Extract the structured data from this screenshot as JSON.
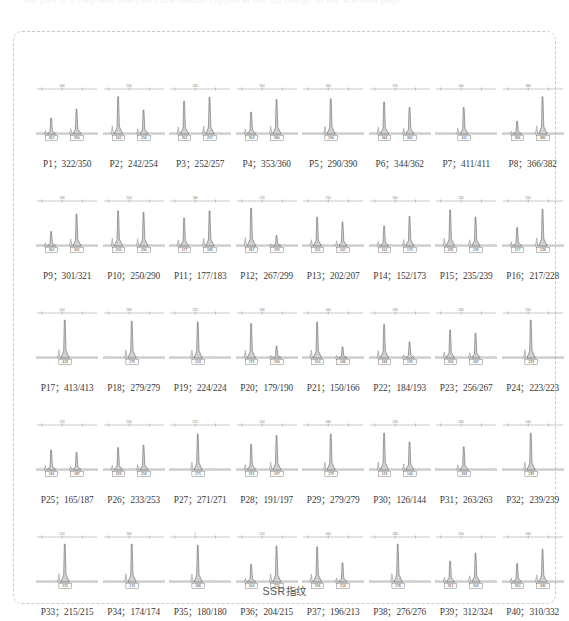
{
  "top_band": {
    "clipped_text": "the part of a fragment analysis trace header clipped at the top margin of the scanned page"
  },
  "caption": "SSR指纹",
  "figure": {
    "panel_count": 40,
    "columns": 8,
    "rows": 5
  },
  "chart_data": {
    "type": "line",
    "title": "SSR指纹",
    "xlabel": "",
    "ylabel": "",
    "grid": false,
    "legend": "none",
    "panels": [
      {
        "id": "P1",
        "label": "P1；322/350",
        "alleles": [
          322,
          350
        ],
        "homozygous": false,
        "peaks": [
          {
            "size": 322,
            "height": 0.4
          },
          {
            "size": 350,
            "height": 0.62
          }
        ],
        "scale_tick": "340"
      },
      {
        "id": "P2",
        "label": "P2；242/254",
        "alleles": [
          242,
          254
        ],
        "homozygous": false,
        "peaks": [
          {
            "size": 242,
            "height": 0.93
          },
          {
            "size": 254,
            "height": 0.6
          }
        ],
        "scale_tick": "240"
      },
      {
        "id": "P3",
        "label": "P3；252/257",
        "alleles": [
          252,
          257
        ],
        "homozygous": false,
        "peaks": [
          {
            "size": 252,
            "height": 0.82
          },
          {
            "size": 257,
            "height": 0.92
          }
        ],
        "scale_tick": "260"
      },
      {
        "id": "P4",
        "label": "P4；353/360",
        "alleles": [
          353,
          360
        ],
        "homozygous": false,
        "peaks": [
          {
            "size": 353,
            "height": 0.55
          },
          {
            "size": 360,
            "height": 0.86
          }
        ],
        "scale_tick": "350"
      },
      {
        "id": "P5",
        "label": "P5；290/390",
        "alleles": [
          290,
          390
        ],
        "homozygous": false,
        "peaks": [
          {
            "size": 290,
            "height": 0.88
          }
        ],
        "scale_tick": "300"
      },
      {
        "id": "P6",
        "label": "P6；344/362",
        "alleles": [
          344,
          362
        ],
        "homozygous": false,
        "peaks": [
          {
            "size": 344,
            "height": 0.8
          },
          {
            "size": 362,
            "height": 0.66
          }
        ],
        "scale_tick": "370"
      },
      {
        "id": "P7",
        "label": "P7；411/411",
        "alleles": [
          411,
          411
        ],
        "homozygous": true,
        "peaks": [
          {
            "size": 411,
            "height": 0.66
          }
        ],
        "scale_tick": "400"
      },
      {
        "id": "P8",
        "label": "P8；366/382",
        "alleles": [
          366,
          382
        ],
        "homozygous": false,
        "peaks": [
          {
            "size": 366,
            "height": 0.32
          },
          {
            "size": 382,
            "height": 0.93
          }
        ],
        "scale_tick": "380"
      },
      {
        "id": "P9",
        "label": "P9；301/321",
        "alleles": [
          301,
          321
        ],
        "homozygous": false,
        "peaks": [
          {
            "size": 301,
            "height": 0.36
          },
          {
            "size": 321,
            "height": 0.8
          }
        ],
        "scale_tick": "290"
      },
      {
        "id": "P10",
        "label": "P10；250/290",
        "alleles": [
          250,
          290
        ],
        "homozygous": false,
        "peaks": [
          {
            "size": 250,
            "height": 0.88
          },
          {
            "size": 290,
            "height": 0.84
          }
        ],
        "scale_tick": "250"
      },
      {
        "id": "P11",
        "label": "P11；177/183",
        "alleles": [
          177,
          183
        ],
        "homozygous": false,
        "peaks": [
          {
            "size": 177,
            "height": 0.7
          },
          {
            "size": 183,
            "height": 0.88
          }
        ],
        "scale_tick": "180"
      },
      {
        "id": "P12",
        "label": "P12；267/299",
        "alleles": [
          267,
          299
        ],
        "homozygous": false,
        "peaks": [
          {
            "size": 267,
            "height": 0.95
          },
          {
            "size": 299,
            "height": 0.26
          }
        ],
        "scale_tick": "270"
      },
      {
        "id": "P13",
        "label": "P13；202/207",
        "alleles": [
          202,
          207
        ],
        "homozygous": false,
        "peaks": [
          {
            "size": 202,
            "height": 0.72
          },
          {
            "size": 207,
            "height": 0.6
          }
        ],
        "scale_tick": "210"
      },
      {
        "id": "P14",
        "label": "P14；152/173",
        "alleles": [
          152,
          173
        ],
        "homozygous": false,
        "peaks": [
          {
            "size": 152,
            "height": 0.5
          },
          {
            "size": 173,
            "height": 0.74
          }
        ],
        "scale_tick": "160"
      },
      {
        "id": "P15",
        "label": "P15；235/239",
        "alleles": [
          235,
          239
        ],
        "homozygous": false,
        "peaks": [
          {
            "size": 235,
            "height": 0.9
          },
          {
            "size": 239,
            "height": 0.72
          }
        ],
        "scale_tick": "230"
      },
      {
        "id": "P16",
        "label": "P16；217/228",
        "alleles": [
          217,
          228
        ],
        "homozygous": false,
        "peaks": [
          {
            "size": 217,
            "height": 0.46
          },
          {
            "size": 228,
            "height": 0.92
          }
        ],
        "scale_tick": "220"
      },
      {
        "id": "P17",
        "label": "P17；413/413",
        "alleles": [
          413,
          413
        ],
        "homozygous": true,
        "peaks": [
          {
            "size": 413,
            "height": 0.95
          }
        ],
        "scale_tick": "410"
      },
      {
        "id": "P18",
        "label": "P18；279/279",
        "alleles": [
          279,
          279
        ],
        "homozygous": true,
        "peaks": [
          {
            "size": 279,
            "height": 0.92
          }
        ],
        "scale_tick": "280"
      },
      {
        "id": "P19",
        "label": "P19；224/224",
        "alleles": [
          224,
          224
        ],
        "homozygous": true,
        "peaks": [
          {
            "size": 224,
            "height": 0.9
          }
        ],
        "scale_tick": "220"
      },
      {
        "id": "P20",
        "label": "P20；179/190",
        "alleles": [
          179,
          190
        ],
        "homozygous": false,
        "peaks": [
          {
            "size": 179,
            "height": 0.86
          },
          {
            "size": 190,
            "height": 0.3
          }
        ],
        "scale_tick": "180"
      },
      {
        "id": "P21",
        "label": "P21；150/166",
        "alleles": [
          150,
          166
        ],
        "homozygous": false,
        "peaks": [
          {
            "size": 150,
            "height": 0.9
          },
          {
            "size": 166,
            "height": 0.28
          }
        ],
        "scale_tick": "160"
      },
      {
        "id": "P22",
        "label": "P22；184/193",
        "alleles": [
          184,
          193
        ],
        "homozygous": false,
        "peaks": [
          {
            "size": 184,
            "height": 0.84
          },
          {
            "size": 193,
            "height": 0.4
          }
        ],
        "scale_tick": "190"
      },
      {
        "id": "P23",
        "label": "P23；256/267",
        "alleles": [
          256,
          267
        ],
        "homozygous": false,
        "peaks": [
          {
            "size": 256,
            "height": 0.7
          },
          {
            "size": 267,
            "height": 0.62
          }
        ],
        "scale_tick": "260"
      },
      {
        "id": "P24",
        "label": "P24；223/223",
        "alleles": [
          223,
          223
        ],
        "homozygous": true,
        "peaks": [
          {
            "size": 223,
            "height": 0.95
          }
        ],
        "scale_tick": "220"
      },
      {
        "id": "P25",
        "label": "P25；165/187",
        "alleles": [
          165,
          187
        ],
        "homozygous": false,
        "peaks": [
          {
            "size": 165,
            "height": 0.5
          },
          {
            "size": 187,
            "height": 0.44
          }
        ],
        "scale_tick": "170"
      },
      {
        "id": "P26",
        "label": "P26；233/253",
        "alleles": [
          233,
          253
        ],
        "homozygous": false,
        "peaks": [
          {
            "size": 233,
            "height": 0.56
          },
          {
            "size": 253,
            "height": 0.62
          }
        ],
        "scale_tick": "240"
      },
      {
        "id": "P27",
        "label": "P27；271/271",
        "alleles": [
          271,
          271
        ],
        "homozygous": true,
        "peaks": [
          {
            "size": 271,
            "height": 0.9
          }
        ],
        "scale_tick": "270"
      },
      {
        "id": "P28",
        "label": "P28；191/197",
        "alleles": [
          191,
          197
        ],
        "homozygous": false,
        "peaks": [
          {
            "size": 191,
            "height": 0.64
          },
          {
            "size": 197,
            "height": 0.86
          }
        ],
        "scale_tick": "200"
      },
      {
        "id": "P29",
        "label": "P29；279/279",
        "alleles": [
          279,
          279
        ],
        "homozygous": true,
        "peaks": [
          {
            "size": 279,
            "height": 0.9
          }
        ],
        "scale_tick": "280"
      },
      {
        "id": "P30",
        "label": "P30；126/144",
        "alleles": [
          126,
          144
        ],
        "homozygous": false,
        "peaks": [
          {
            "size": 126,
            "height": 0.92
          },
          {
            "size": 144,
            "height": 0.7
          }
        ],
        "scale_tick": "130"
      },
      {
        "id": "P31",
        "label": "P31；263/263",
        "alleles": [
          263,
          263
        ],
        "homozygous": true,
        "peaks": [
          {
            "size": 263,
            "height": 0.58
          }
        ],
        "scale_tick": "260"
      },
      {
        "id": "P32",
        "label": "P32；239/239",
        "alleles": [
          239,
          239
        ],
        "homozygous": true,
        "peaks": [
          {
            "size": 239,
            "height": 0.92
          }
        ],
        "scale_tick": "240"
      },
      {
        "id": "P33",
        "label": "P33；215/215",
        "alleles": [
          215,
          215
        ],
        "homozygous": true,
        "peaks": [
          {
            "size": 215,
            "height": 0.95
          }
        ],
        "scale_tick": "220"
      },
      {
        "id": "P34",
        "label": "P34；174/174",
        "alleles": [
          174,
          174
        ],
        "homozygous": true,
        "peaks": [
          {
            "size": 174,
            "height": 0.95
          }
        ],
        "scale_tick": "180"
      },
      {
        "id": "P35",
        "label": "P35；180/180",
        "alleles": [
          180,
          180
        ],
        "homozygous": true,
        "peaks": [
          {
            "size": 180,
            "height": 0.92
          }
        ],
        "scale_tick": "2"
      },
      {
        "id": "P36",
        "label": "P36；204/215",
        "alleles": [
          204,
          215
        ],
        "homozygous": false,
        "peaks": [
          {
            "size": 204,
            "height": 0.44
          },
          {
            "size": 215,
            "height": 0.9
          }
        ],
        "scale_tick": "210"
      },
      {
        "id": "P37",
        "label": "P37；196/213",
        "alleles": [
          196,
          213
        ],
        "homozygous": false,
        "peaks": [
          {
            "size": 196,
            "height": 0.88
          },
          {
            "size": 213,
            "height": 0.48
          }
        ],
        "scale_tick": "200"
      },
      {
        "id": "P38",
        "label": "P38；276/276",
        "alleles": [
          276,
          276
        ],
        "homozygous": true,
        "peaks": [
          {
            "size": 276,
            "height": 0.95
          }
        ],
        "scale_tick": "280"
      },
      {
        "id": "P39",
        "label": "P39；312/324",
        "alleles": [
          312,
          324
        ],
        "homozygous": false,
        "peaks": [
          {
            "size": 312,
            "height": 0.52
          },
          {
            "size": 324,
            "height": 0.72
          }
        ],
        "scale_tick": "310"
      },
      {
        "id": "P40",
        "label": "P40；310/332",
        "alleles": [
          310,
          332
        ],
        "homozygous": false,
        "peaks": [
          {
            "size": 310,
            "height": 0.46
          },
          {
            "size": 332,
            "height": 0.82
          }
        ],
        "scale_tick": "330"
      }
    ]
  }
}
